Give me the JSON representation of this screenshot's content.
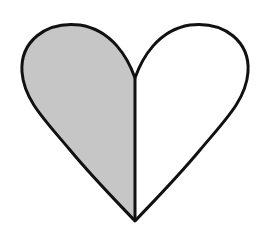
{
  "figure": {
    "shape": "heart",
    "left_half": {
      "fill": "#c6c6c6",
      "shaded": true
    },
    "right_half": {
      "fill": "#ffffff",
      "shaded": false
    },
    "outline_color": "#111111",
    "fraction_shaded": "1/2"
  }
}
